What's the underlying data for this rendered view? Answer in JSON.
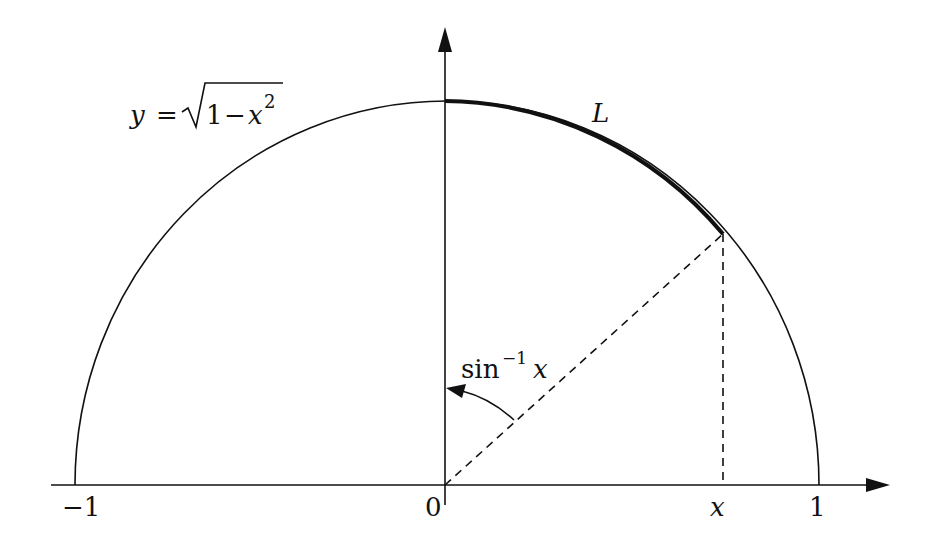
{
  "diagram": {
    "curve_label": {
      "lhs": "y",
      "eq": "=",
      "radical": "√",
      "radicand_1": "1",
      "minus": "−",
      "radicand_x": "x",
      "exponent": "2"
    },
    "arc_label": "L",
    "angle_label": {
      "func": "sin",
      "sup": "−1",
      "arg": "x"
    },
    "x_axis_ticks": {
      "neg_one": "−1",
      "zero": "0",
      "x": "x",
      "one": "1"
    },
    "colors": {
      "stroke": "#111111",
      "background": "#ffffff"
    },
    "geometry": {
      "origin_px": [
        445,
        485
      ],
      "radius_x_px": 372,
      "radius_y_px": 384,
      "point_px": [
        723,
        234
      ],
      "x_value_approx": 0.75
    }
  }
}
